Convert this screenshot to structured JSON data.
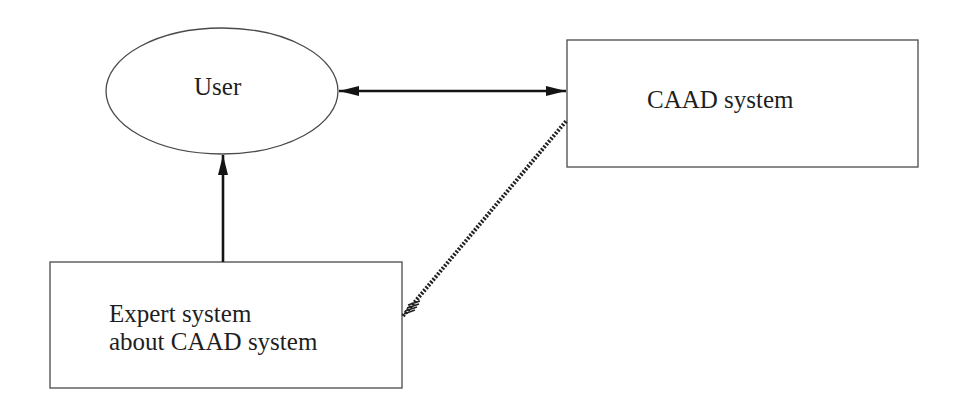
{
  "diagram": {
    "nodes": [
      {
        "id": "user",
        "shape": "ellipse",
        "label": "User"
      },
      {
        "id": "caad",
        "shape": "rectangle",
        "label": "CAAD system"
      },
      {
        "id": "expert",
        "shape": "rectangle",
        "label_lines": [
          "Expert system",
          "about CAAD system"
        ]
      }
    ],
    "edges": [
      {
        "from": "user",
        "to": "caad",
        "style": "solid",
        "arrow": "both"
      },
      {
        "from": "expert",
        "to": "user",
        "style": "solid",
        "arrow": "end"
      },
      {
        "from": "expert",
        "to": "caad",
        "style": "hatched",
        "arrow": "none"
      }
    ],
    "colors": {
      "stroke": "#3a3a3a",
      "arrow": "#141414",
      "text": "#1e1e1e",
      "background": "#ffffff"
    }
  }
}
